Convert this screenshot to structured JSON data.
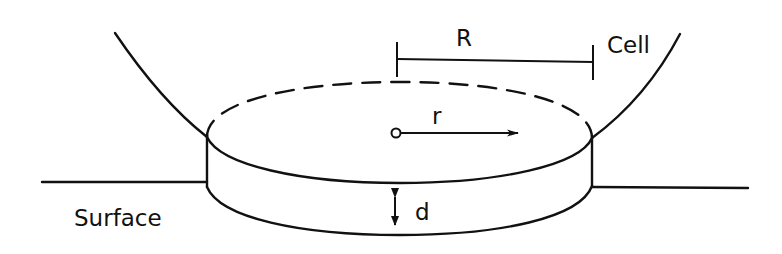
{
  "diagram": {
    "labels": {
      "radius_total": "R",
      "cell": "Cell",
      "radial_coordinate": "r",
      "gap_thickness": "d",
      "surface": "Surface"
    },
    "colors": {
      "line": "#111111",
      "background": "#ffffff"
    },
    "elements": [
      "cell-membrane-left",
      "cell-membrane-right",
      "contact-disc-top-back-dashed",
      "contact-disc-top-front",
      "contact-disc-bottom-front",
      "surface-line",
      "radius-scale-bar",
      "radial-arrow",
      "thickness-arrow"
    ]
  }
}
